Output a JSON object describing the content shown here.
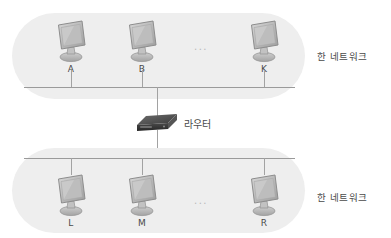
{
  "diagram": {
    "router": {
      "label": "라우터",
      "icon": "router-icon"
    },
    "networks": [
      {
        "id": "top",
        "side_label": "한 네트워크",
        "ellipsis": "...",
        "hosts": [
          {
            "label": "A",
            "icon": "computer-icon"
          },
          {
            "label": "B",
            "icon": "computer-icon"
          },
          {
            "label": "K",
            "icon": "computer-icon"
          }
        ]
      },
      {
        "id": "bottom",
        "side_label": "한 네트워크",
        "ellipsis": "...",
        "hosts": [
          {
            "label": "L",
            "icon": "computer-icon"
          },
          {
            "label": "M",
            "icon": "computer-icon"
          },
          {
            "label": "R",
            "icon": "computer-icon"
          }
        ]
      }
    ],
    "colors": {
      "capsule_fill": "#eeeeee",
      "bus_line": "#9a9a9a",
      "drop_line": "#a2a2a2",
      "text": "#4a4a4a",
      "ellipsis": "#b9b9b9",
      "router_body": "#3b3b3b",
      "background": "#ffffff"
    }
  }
}
